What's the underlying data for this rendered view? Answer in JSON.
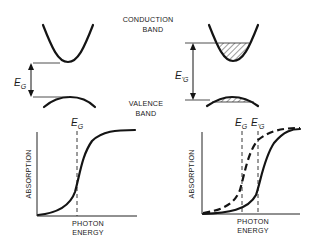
{
  "figure": {
    "labels": {
      "conduction_band_line1": "CONDUCTION",
      "conduction_band_line2": "BAND",
      "valence_band_line1": "VALENCE",
      "valence_band_line2": "BAND"
    },
    "left_band_diagram": {
      "gap_symbol": "E",
      "gap_subscript": "G",
      "description": "Unfilled conduction and valence bands separated by band gap"
    },
    "right_band_diagram": {
      "gap_symbol": "E",
      "gap_subscript": "'G",
      "description": "Band-filled conduction band (hatched) and hatched valence band top; larger apparent gap"
    },
    "left_absorption_plot": {
      "ylabel": "ABSORPTION",
      "xlabel_line1": "PHOTON",
      "xlabel_line2": "ENERGY",
      "marker_symbol": "E",
      "marker_subscript": "G"
    },
    "right_absorption_plot": {
      "ylabel": "ABSORPTION",
      "xlabel_line1": "PHOTON",
      "xlabel_line2": "ENERGY",
      "marker1_symbol": "E",
      "marker1_subscript": "G",
      "marker2_symbol": "E",
      "marker2_subscript": "'G"
    }
  },
  "colors": {
    "ink": "#141414",
    "background": "#ffffff"
  }
}
